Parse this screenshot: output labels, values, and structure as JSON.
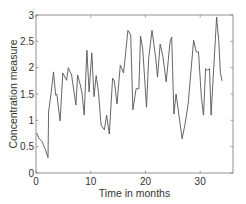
{
  "chart_data": {
    "type": "line",
    "title": "",
    "xlabel": "Time in months",
    "ylabel": "Concentration measure",
    "xlim": [
      0,
      36
    ],
    "ylim": [
      0,
      3
    ],
    "xticks": [
      0,
      10,
      20,
      30
    ],
    "xtick_labels": [
      "0",
      "10",
      "20",
      "30"
    ],
    "yticks": [
      0,
      0.5,
      1,
      1.5,
      2,
      2.5,
      3
    ],
    "ytick_labels": [
      "0",
      "0.5",
      "1",
      "1.5",
      "2",
      "2.5",
      "3"
    ],
    "grid": false,
    "legend": null,
    "series": [
      {
        "name": "concentration",
        "color": "#555555",
        "x": [
          0.1,
          0.6,
          1.1,
          1.7,
          2.2,
          2.3,
          2.8,
          3.2,
          3.6,
          3.8,
          4.4,
          4.9,
          5.6,
          5.9,
          6.5,
          7.3,
          7.6,
          8.1,
          8.4,
          8.8,
          9.3,
          9.7,
          10.2,
          10.6,
          11.0,
          11.4,
          11.9,
          12.5,
          12.9,
          13.4,
          14.0,
          14.3,
          14.8,
          15.4,
          16.0,
          16.8,
          17.3,
          17.7,
          18.3,
          18.8,
          19.1,
          19.5,
          20.2,
          20.6,
          21.2,
          21.9,
          22.2,
          22.7,
          23.2,
          23.8,
          24.5,
          24.8,
          25.2,
          25.6,
          26.7,
          27.2,
          27.8,
          28.8,
          29.3,
          29.7,
          30.2,
          30.6,
          31.0,
          31.3,
          31.7,
          32.0,
          33.0,
          33.4,
          33.7,
          34.0
        ],
        "values": [
          0.76,
          0.65,
          0.6,
          0.45,
          0.29,
          1.16,
          1.55,
          1.92,
          1.48,
          1.5,
          0.99,
          1.9,
          1.76,
          2.0,
          1.86,
          1.29,
          1.86,
          1.67,
          1.52,
          1.1,
          2.33,
          1.54,
          2.28,
          1.45,
          1.85,
          1.55,
          0.91,
          0.82,
          1.1,
          0.74,
          1.8,
          1.75,
          1.31,
          2.05,
          1.9,
          2.71,
          2.62,
          1.2,
          1.6,
          1.6,
          2.6,
          2.36,
          1.25,
          2.18,
          2.71,
          2.17,
          1.82,
          2.45,
          2.2,
          1.73,
          2.5,
          2.58,
          1.12,
          1.5,
          0.65,
          0.9,
          1.3,
          2.52,
          2.3,
          2.3,
          1.45,
          1.1,
          1.98,
          1.95,
          1.98,
          1.1,
          2.96,
          2.5,
          1.9,
          1.75
        ]
      }
    ]
  }
}
